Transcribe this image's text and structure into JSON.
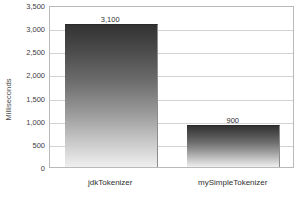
{
  "chart_data": {
    "type": "bar",
    "title": "",
    "xlabel": "",
    "ylabel": "Milliseconds",
    "categories": [
      "jdkTokenizer",
      "mySimpleTokenizer"
    ],
    "values": [
      3100,
      900
    ],
    "value_labels": [
      "3,100",
      "900"
    ],
    "ylim": [
      0,
      3500
    ],
    "ytick_values": [
      0,
      500,
      1000,
      1500,
      2000,
      2500,
      3000,
      3500
    ],
    "ytick_labels": [
      "0",
      "500",
      "1,000",
      "1,500",
      "2,000",
      "2,500",
      "3,000",
      "3,500"
    ],
    "grid": true,
    "legend": false,
    "legend_position": "none",
    "colors": {
      "bar_top": "#323232",
      "bar_bottom": "#efefef",
      "gridline": "#d2d2d2",
      "plot_border": "#b9b9b9",
      "background": "#ffffff",
      "text": "#2f2f2f"
    }
  }
}
